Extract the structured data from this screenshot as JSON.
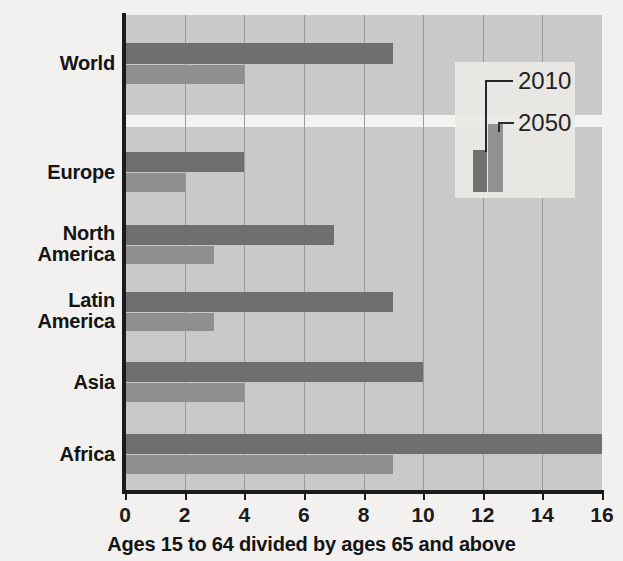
{
  "chart_data": {
    "type": "bar",
    "orientation": "horizontal",
    "title": "",
    "xlabel": "Ages 15 to 64 divided by ages 65 and above",
    "ylabel": "",
    "xlim": [
      0,
      16
    ],
    "xticks": [
      0,
      2,
      4,
      6,
      8,
      10,
      12,
      14,
      16
    ],
    "xtick_labels": [
      "0",
      "2",
      "4",
      "6",
      "8",
      "10",
      "12",
      "14",
      "16"
    ],
    "grid": true,
    "grid_axis": "x",
    "categories": [
      "World",
      "Europe",
      "North America",
      "Latin America",
      "Asia",
      "Africa"
    ],
    "series": [
      {
        "name": "2010",
        "color": "#6f6f6f",
        "values": [
          9,
          4,
          7,
          9,
          10,
          16
        ]
      },
      {
        "name": "2050",
        "color": "#8f8f8f",
        "values": [
          4,
          2,
          3,
          3,
          4,
          9
        ]
      }
    ],
    "legend": {
      "position": "top-right",
      "entries": [
        {
          "label": "2010",
          "color": "#6f6f6f"
        },
        {
          "label": "2050",
          "color": "#8f8f8f"
        }
      ]
    },
    "colors": {
      "plot_background": "#c9c9c9",
      "page_background": "#f2f1ef",
      "gridline": "#9b9b9b",
      "axis": "#1b1b1b",
      "text": "#141414",
      "legend_background": "#eceae7",
      "band": "#f4f3f1"
    }
  },
  "categories_display": [
    {
      "lines": [
        "World"
      ],
      "center_y": 63
    },
    {
      "lines": [
        "Europe"
      ],
      "center_y": 172
    },
    {
      "lines": [
        "North",
        "America"
      ],
      "center_y": 244
    },
    {
      "lines": [
        "Latin",
        "America"
      ],
      "center_y": 311
    },
    {
      "lines": [
        "Asia"
      ],
      "center_y": 382
    },
    {
      "lines": [
        "Africa"
      ],
      "center_y": 454
    }
  ],
  "legend_labels": {
    "first": "2010",
    "second": "2050"
  }
}
